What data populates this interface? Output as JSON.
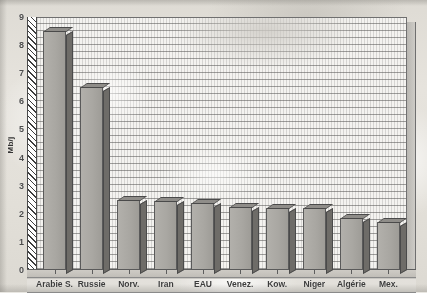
{
  "chart_data": {
    "type": "bar",
    "title": "",
    "xlabel": "",
    "ylabel": "Mb/j",
    "ylim": [
      0,
      9
    ],
    "yticks": [
      0,
      1,
      2,
      3,
      4,
      5,
      6,
      7,
      8,
      9
    ],
    "ytick_labels": [
      "0",
      "1",
      "2",
      "3",
      "4",
      "5",
      "6",
      "7",
      "8",
      "9"
    ],
    "grid": true,
    "legend": "none",
    "categories": [
      "Arabie S.",
      "Russie",
      "Norv.",
      "Iran",
      "EAU",
      "Venez.",
      "Kow.",
      "Niger",
      "Algérie",
      "Mex."
    ],
    "values": [
      8.5,
      6.5,
      2.5,
      2.45,
      2.4,
      2.25,
      2.2,
      2.2,
      1.85,
      1.7
    ],
    "series": [
      {
        "name": "Production",
        "values": [
          8.5,
          6.5,
          2.5,
          2.45,
          2.4,
          2.25,
          2.2,
          2.2,
          1.85,
          1.7
        ]
      }
    ]
  },
  "style": {
    "bar_face_color": "#a9a7a2",
    "bar_side_color": "#6e6c68",
    "bar_top_color": "#8f8d89",
    "bar_border_color": "#5a5a5a",
    "plot_background_color": "#f4f3f0",
    "gridline_color": "#5a5a5a",
    "axis_color": "#4a4a4a",
    "page_background_color": "#e3e0d9",
    "text_color": "#3a3a3a"
  }
}
